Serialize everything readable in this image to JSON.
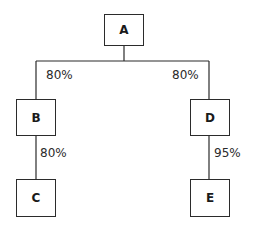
{
  "diagram": {
    "type": "tree",
    "nodes": [
      {
        "id": "A",
        "label": "A"
      },
      {
        "id": "B",
        "label": "B"
      },
      {
        "id": "C",
        "label": "C"
      },
      {
        "id": "D",
        "label": "D"
      },
      {
        "id": "E",
        "label": "E"
      }
    ],
    "edges": [
      {
        "from": "A",
        "to": "B",
        "label": "80%"
      },
      {
        "from": "A",
        "to": "D",
        "label": "80%"
      },
      {
        "from": "B",
        "to": "C",
        "label": "80%"
      },
      {
        "from": "D",
        "to": "E",
        "label": "95%"
      }
    ],
    "colors": {
      "line": "#2b2b2b",
      "background": "#ffffff",
      "text": "#1a1a1a"
    }
  }
}
